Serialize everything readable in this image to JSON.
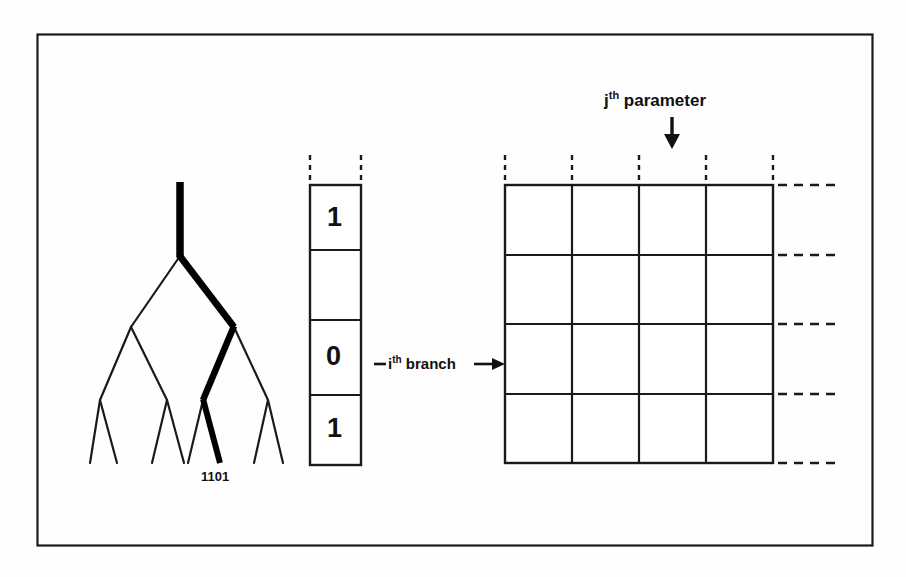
{
  "figure": {
    "frame": {
      "color": "#1a1a1a"
    },
    "background": "#fefefe"
  },
  "tree": {
    "leaf_code": "1101",
    "highlight_color": "#000000",
    "line_color": "#1a1a1a",
    "description": "binary bifurcating tree with bold highlighted path from root to one leaf"
  },
  "vector": {
    "cells": [
      {
        "value": "1"
      },
      {
        "value": ""
      },
      {
        "value": "0"
      },
      {
        "value": "1"
      }
    ]
  },
  "branch_annotation": {
    "prefix": "i",
    "superscript": "th",
    "suffix": " branch"
  },
  "parameter_annotation": {
    "prefix": "j",
    "superscript": "th",
    "suffix": " parameter"
  },
  "grid": {
    "rows": 4,
    "cols": 4,
    "line_color": "#1a1a1a"
  }
}
